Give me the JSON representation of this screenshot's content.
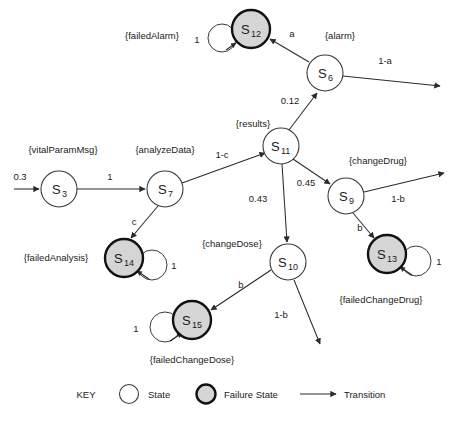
{
  "diagram": {
    "nodes": [
      {
        "id": "S3",
        "label": "S",
        "sub": "3",
        "type": "state",
        "x": 59,
        "y": 189,
        "r": 18
      },
      {
        "id": "S7",
        "label": "S",
        "sub": "7",
        "type": "state",
        "x": 165,
        "y": 189,
        "r": 18
      },
      {
        "id": "S11",
        "label": "S",
        "sub": "11",
        "type": "state",
        "x": 281,
        "y": 146,
        "r": 18
      },
      {
        "id": "S6",
        "label": "S",
        "sub": "6",
        "type": "state",
        "x": 325,
        "y": 73,
        "r": 18
      },
      {
        "id": "S9",
        "label": "S",
        "sub": "9",
        "type": "state",
        "x": 346,
        "y": 196,
        "r": 18
      },
      {
        "id": "S10",
        "label": "S",
        "sub": "10",
        "type": "state",
        "x": 288,
        "y": 262,
        "r": 18
      },
      {
        "id": "S12",
        "label": "S",
        "sub": "12",
        "type": "failure",
        "x": 251,
        "y": 29,
        "r": 19
      },
      {
        "id": "S13",
        "label": "S",
        "sub": "13",
        "type": "failure",
        "x": 387,
        "y": 254,
        "r": 19
      },
      {
        "id": "S14",
        "label": "S",
        "sub": "14",
        "type": "failure",
        "x": 124,
        "y": 258,
        "r": 19
      },
      {
        "id": "S15",
        "label": "S",
        "sub": "15",
        "type": "failure",
        "x": 192,
        "y": 320,
        "r": 19
      }
    ],
    "set_labels": [
      {
        "name": "failedAlarm",
        "text": "{failedAlarm}",
        "x": 152,
        "y": 36
      },
      {
        "name": "alarm",
        "text": "{alarm}",
        "x": 340,
        "y": 36
      },
      {
        "name": "results",
        "text": "{results}",
        "x": 253,
        "y": 124
      },
      {
        "name": "vitalParamMsg",
        "text": "{vitalParamMsg}",
        "x": 63,
        "y": 150
      },
      {
        "name": "analyzeData",
        "text": "{analyzeData}",
        "x": 165,
        "y": 150
      },
      {
        "name": "changeDrug",
        "text": "{changeDrug}",
        "x": 376,
        "y": 161
      },
      {
        "name": "failedAnalysis",
        "text": "{failedAnalysis}",
        "x": 56,
        "y": 258
      },
      {
        "name": "changeDose",
        "text": "{changeDose}",
        "x": 232,
        "y": 244
      },
      {
        "name": "failedChangeDrug",
        "text": "{failedChangeDrug}",
        "x": 380,
        "y": 300
      },
      {
        "name": "failedChangeDose",
        "text": "{failedChangeDose}",
        "x": 192,
        "y": 360
      }
    ],
    "edge_labels": [
      {
        "name": "entry-prob",
        "text": "0.3",
        "x": 20,
        "y": 180
      },
      {
        "name": "s3-s7",
        "text": "1",
        "x": 110,
        "y": 180
      },
      {
        "name": "s7-s11",
        "text": "1-c",
        "x": 222,
        "y": 158
      },
      {
        "name": "s7-s14",
        "text": "c",
        "x": 134,
        "y": 225
      },
      {
        "name": "s12-loop",
        "text": "1",
        "x": 197,
        "y": 40
      },
      {
        "name": "s6-s12",
        "text": "a",
        "x": 292,
        "y": 35
      },
      {
        "name": "s6-out",
        "text": "1-a",
        "x": 385,
        "y": 62
      },
      {
        "name": "s11-s6",
        "text": "0.12",
        "x": 290,
        "y": 101
      },
      {
        "name": "s11-s9",
        "text": "0.45",
        "x": 305,
        "y": 185
      },
      {
        "name": "s11-s10",
        "text": "0.43",
        "x": 258,
        "y": 200
      },
      {
        "name": "s9-out",
        "text": "1-b",
        "x": 397,
        "y": 199
      },
      {
        "name": "s9-s13",
        "text": "b",
        "x": 360,
        "y": 230
      },
      {
        "name": "s13-loop",
        "text": "1",
        "x": 437,
        "y": 262
      },
      {
        "name": "s14-loop",
        "text": "1",
        "x": 172,
        "y": 266
      },
      {
        "name": "s10-s15",
        "text": "b",
        "x": 241,
        "y": 286
      },
      {
        "name": "s10-out",
        "text": "1-b",
        "x": 281,
        "y": 316
      },
      {
        "name": "s15-loop",
        "text": "1",
        "x": 136,
        "y": 329
      }
    ],
    "key": {
      "title": "KEY",
      "state": "State",
      "failure_state": "Failure State",
      "transition": "Transition"
    }
  }
}
